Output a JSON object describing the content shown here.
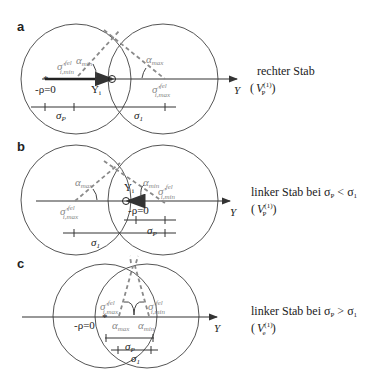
{
  "panels": [
    {
      "letter": "a",
      "caption_line1": "rechter Stab",
      "caption_line2_var": "V",
      "caption_line2_sub": "P",
      "caption_line2_sup": "(1)",
      "axis_label": "Y",
      "origin_label": "-ρ=0",
      "point_label": "Y",
      "point_sub": "i",
      "alpha_min": "α",
      "alpha_min_sub": "min",
      "alpha_max": "α",
      "alpha_max_sub": "max",
      "sigma_min": "σ'",
      "sigma_min_sup": "fel",
      "sigma_min_sub": "i,min",
      "sigma_max": "σ'",
      "sigma_max_sup": "fel",
      "sigma_max_sub": "i,max",
      "seg1_label": "σ",
      "seg1_sub": "P",
      "seg2_label": "σ",
      "seg2_sub": "1"
    },
    {
      "letter": "b",
      "caption_line1": "linker Stab bei σ",
      "caption_cond_sub1": "P",
      "caption_cond_op": " < σ",
      "caption_cond_sub2": "1",
      "caption_line2_var": "V",
      "caption_line2_sub": "P",
      "caption_line2_sup": "(1)",
      "axis_label": "Y",
      "origin_label": "-ρ=0",
      "point_label": "Y",
      "point_sub": "i",
      "alpha_min": "α",
      "alpha_min_sub": "min",
      "alpha_max": "α",
      "alpha_max_sub": "max",
      "sigma_min": "σ'",
      "sigma_min_sup": "fel",
      "sigma_min_sub": "i,min",
      "sigma_max": "σ'",
      "sigma_max_sup": "fel",
      "sigma_max_sub": "i,max",
      "seg1_label": "σ",
      "seg1_sub": "P",
      "seg2_label": "σ",
      "seg2_sub": "1"
    },
    {
      "letter": "c",
      "caption_line1": "linker Stab bei σ",
      "caption_cond_sub1": "P",
      "caption_cond_op": " > σ",
      "caption_cond_sub2": "1",
      "caption_line2_var": "V",
      "caption_line2_sub": "e",
      "caption_line2_sup": "(1)",
      "axis_label": "Y",
      "origin_label": "-ρ=0",
      "alpha_min": "α",
      "alpha_min_sub": "min",
      "alpha_max": "α",
      "alpha_max_sub": "max",
      "sigma_min": "σ'",
      "sigma_min_sup": "fel",
      "sigma_min_sub": "i,min",
      "sigma_max": "σ'",
      "sigma_max_sup": "fel",
      "sigma_max_sub": "i,max",
      "seg1_label": "σ",
      "seg1_sub": "P",
      "seg2_label": "σ",
      "seg2_sub": "1"
    }
  ],
  "colors": {
    "line": "#333333",
    "circle": "#555555",
    "dashed": "#8a8a8a",
    "gray_label": "#888888"
  }
}
